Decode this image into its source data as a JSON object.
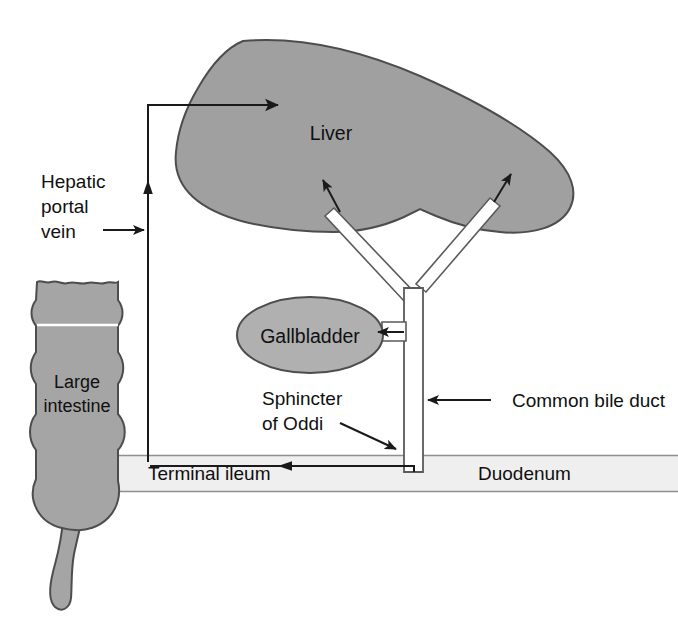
{
  "figure": {
    "background_color": "#ffffff"
  },
  "colors": {
    "organ_fill": "#a0a0a0",
    "organ_stroke": "#4d4d4d",
    "gallbladder_fill": "#b0b0b0",
    "intestine_band_fill": "#efefef",
    "intestine_band_stroke": "#9a9a9a",
    "duct_fill": "#ffffff",
    "duct_stroke": "#555555",
    "line_color": "#1a1a1a",
    "text_color": "#101010"
  },
  "labels": {
    "liver": "Liver",
    "hepatic_portal_vein": [
      "Hepatic",
      "portal",
      "vein"
    ],
    "large_intestine": [
      "Large",
      "intestine"
    ],
    "gallbladder": "Gallbladder",
    "sphincter_of_oddi": [
      "Sphincter",
      "of Oddi"
    ],
    "terminal_ileum": "Terminal ileum",
    "duodenum": "Duodenum",
    "common_bile_duct": "Common bile duct"
  },
  "structures": [
    {
      "name": "liver",
      "type": "organ",
      "fill": "#a0a0a0"
    },
    {
      "name": "gallbladder",
      "type": "organ",
      "fill": "#b0b0b0"
    },
    {
      "name": "large-intestine",
      "type": "organ",
      "fill": "#a0a0a0"
    },
    {
      "name": "appendix",
      "type": "organ",
      "fill": "#a0a0a0"
    },
    {
      "name": "common-bile-duct",
      "type": "duct",
      "fill": "#ffffff"
    },
    {
      "name": "hepatic-ducts",
      "type": "duct",
      "fill": "#ffffff"
    },
    {
      "name": "cystic-duct",
      "type": "duct",
      "fill": "#ffffff"
    },
    {
      "name": "duodenum-band",
      "type": "lumen",
      "fill": "#efefef"
    },
    {
      "name": "ileum-band",
      "type": "lumen",
      "fill": "#efefef"
    }
  ],
  "connectors": [
    {
      "name": "portal-vein-flow",
      "from": "terminal-ileum",
      "to": "liver",
      "style": "arrow"
    },
    {
      "name": "hepatic-duct-left-arrow",
      "from": "duct",
      "to": "liver",
      "style": "arrow"
    },
    {
      "name": "hepatic-duct-right-arrow",
      "from": "duct",
      "to": "liver",
      "style": "arrow"
    },
    {
      "name": "cystic-duct-arrow",
      "from": "common-bile-duct",
      "to": "gallbladder",
      "style": "arrow"
    },
    {
      "name": "bile-flow-into-ileum",
      "from": "duodenum",
      "to": "terminal-ileum",
      "style": "arrow"
    },
    {
      "name": "sphincter-pointer",
      "from": "label",
      "to": "duct-outlet",
      "style": "arrow"
    },
    {
      "name": "common-bile-duct-pointer",
      "from": "label",
      "to": "duct",
      "style": "arrow"
    },
    {
      "name": "hepatic-portal-vein-pointer",
      "from": "label",
      "to": "vein-line",
      "style": "arrow"
    }
  ]
}
